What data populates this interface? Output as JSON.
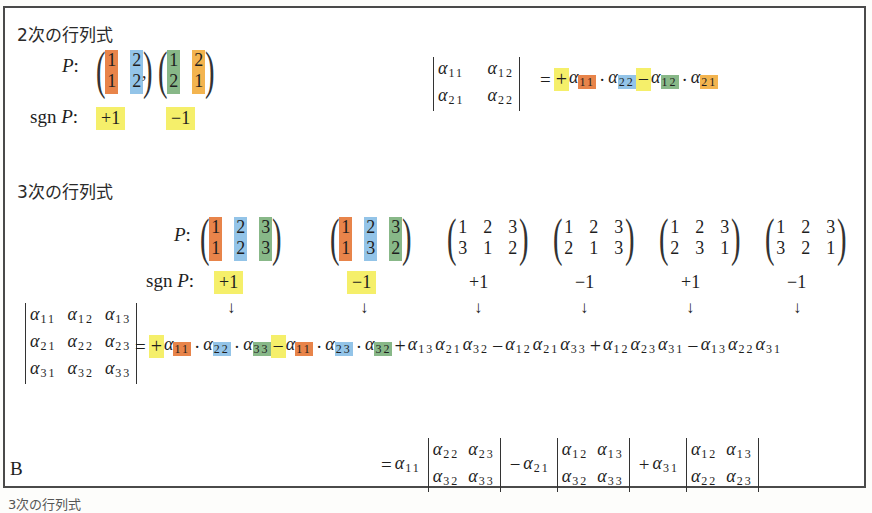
{
  "section2": {
    "heading": "2次の行列式",
    "p_label": "P",
    "sgn_label": "sgn",
    "permutations": [
      {
        "top": [
          "1",
          "2"
        ],
        "bottom": [
          "1",
          "2"
        ],
        "colors": [
          "orange",
          "blue"
        ],
        "sign": "+1"
      },
      {
        "top": [
          "1",
          "2"
        ],
        "bottom": [
          "2",
          "1"
        ],
        "colors": [
          "green",
          "amber"
        ],
        "sign": "−1"
      }
    ],
    "separator": ",",
    "det_matrix": [
      [
        "α11",
        "α12"
      ],
      [
        "α21",
        "α22"
      ]
    ],
    "expansion": {
      "terms": [
        {
          "sign": "+",
          "factors": [
            {
              "sym": "α",
              "sub": "11",
              "color": "orange"
            },
            {
              "sym": "α",
              "sub": "22",
              "color": "blue"
            }
          ]
        },
        {
          "sign": "−",
          "factors": [
            {
              "sym": "α",
              "sub": "12",
              "color": "green"
            },
            {
              "sym": "α",
              "sub": "21",
              "color": "amber"
            }
          ]
        }
      ]
    }
  },
  "section3": {
    "heading": "3次の行列式",
    "p_label": "P",
    "sgn_label": "sgn",
    "permutations": [
      {
        "top": [
          "1",
          "2",
          "3"
        ],
        "bottom": [
          "1",
          "2",
          "3"
        ],
        "sign": "+1",
        "highlighted": true
      },
      {
        "top": [
          "1",
          "2",
          "3"
        ],
        "bottom": [
          "1",
          "3",
          "2"
        ],
        "sign": "−1",
        "highlighted": true
      },
      {
        "top": [
          "1",
          "2",
          "3"
        ],
        "bottom": [
          "3",
          "1",
          "2"
        ],
        "sign": "+1",
        "highlighted": false
      },
      {
        "top": [
          "1",
          "2",
          "3"
        ],
        "bottom": [
          "2",
          "1",
          "3"
        ],
        "sign": "−1",
        "highlighted": false
      },
      {
        "top": [
          "1",
          "2",
          "3"
        ],
        "bottom": [
          "2",
          "3",
          "1"
        ],
        "sign": "+1",
        "highlighted": false
      },
      {
        "top": [
          "1",
          "2",
          "3"
        ],
        "bottom": [
          "3",
          "2",
          "1"
        ],
        "sign": "−1",
        "highlighted": false
      }
    ],
    "arrow": "↓",
    "det_matrix": [
      [
        "α11",
        "α12",
        "α13"
      ],
      [
        "α21",
        "α22",
        "α23"
      ],
      [
        "α31",
        "α32",
        "α33"
      ]
    ],
    "expansion": [
      {
        "sign": "+",
        "subs": [
          "11",
          "22",
          "33"
        ],
        "colored": true
      },
      {
        "sign": "−",
        "subs": [
          "11",
          "23",
          "32"
        ],
        "colored": true
      },
      {
        "sign": "+",
        "subs": [
          "13",
          "21",
          "32"
        ],
        "colored": false
      },
      {
        "sign": "−",
        "subs": [
          "12",
          "21",
          "33"
        ],
        "colored": false
      },
      {
        "sign": "+",
        "subs": [
          "12",
          "23",
          "31"
        ],
        "colored": false
      },
      {
        "sign": "−",
        "subs": [
          "13",
          "22",
          "31"
        ],
        "colored": false
      }
    ],
    "cofactor_expansion": [
      {
        "sign": "=",
        "coef_sub": "11",
        "minor": [
          [
            "22",
            "23"
          ],
          [
            "32",
            "33"
          ]
        ]
      },
      {
        "sign": "−",
        "coef_sub": "21",
        "minor": [
          [
            "12",
            "13"
          ],
          [
            "32",
            "33"
          ]
        ]
      },
      {
        "sign": "+",
        "coef_sub": "31",
        "minor": [
          [
            "12",
            "13"
          ],
          [
            "22",
            "23"
          ]
        ]
      }
    ]
  },
  "figure_label": "B",
  "caption_partial": "3次の行列式",
  "colors": {
    "orange": "#e8844a",
    "blue": "#93c4e8",
    "green": "#88b888",
    "amber": "#f3b44f",
    "yellow": "#f5ef6a",
    "border": "#4a4a4a"
  },
  "symbols": {
    "alpha": "α",
    "dot": "·",
    "equals": "=",
    "colon": ":"
  }
}
